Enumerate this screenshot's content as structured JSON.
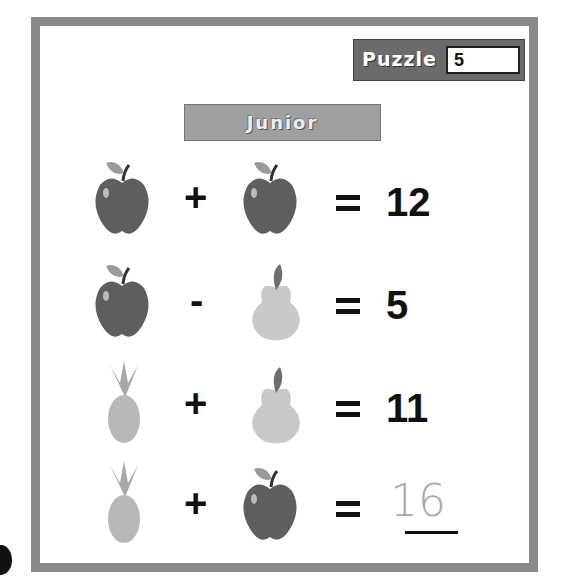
{
  "puzzle": {
    "label": "Puzzle",
    "number": "5"
  },
  "level": {
    "label": "Junior"
  },
  "equations": [
    {
      "left": "apple",
      "operator": "+",
      "right": "apple",
      "equals": "=",
      "result": "12"
    },
    {
      "left": "apple",
      "operator": "-",
      "right": "pear",
      "equals": "=",
      "result": "5"
    },
    {
      "left": "pineapple",
      "operator": "+",
      "right": "pear",
      "equals": "=",
      "result": "11"
    },
    {
      "left": "pineapple",
      "operator": "+",
      "right": "apple",
      "equals": "=",
      "result": "",
      "handwritten_answer": "16"
    }
  ],
  "colors": {
    "border": "#8a8a8a",
    "puzzle_box": "#6b6b6b",
    "junior_banner": "#a0a0a0",
    "apple": "#5e5e5e",
    "pear": "#c8c8c8",
    "pineapple": "#b8b8b8"
  }
}
